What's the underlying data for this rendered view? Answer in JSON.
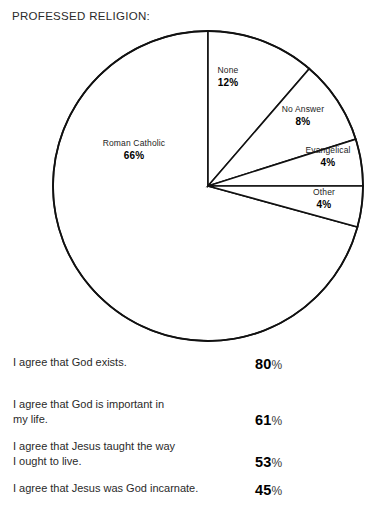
{
  "title": "PROFESSED RELIGION:",
  "chart_data": {
    "type": "pie",
    "title": "PROFESSED RELIGION:",
    "categories": [
      "Roman Catholic",
      "None",
      "No Answer",
      "Evangelical",
      "Other"
    ],
    "values": [
      66,
      12,
      8,
      4,
      4
    ],
    "unit": "%",
    "legend": "none",
    "labels_inside": true,
    "start_angle_deg": 0,
    "direction": "clockwise",
    "slices": [
      {
        "label": "Roman Catholic",
        "value": 66,
        "value_text": "66%",
        "start_deg": 105.3,
        "end_deg": 360.0
      },
      {
        "label": "None",
        "value": 12,
        "value_text": "12%",
        "start_deg": 0.0,
        "end_deg": 40.8
      },
      {
        "label": "No Answer",
        "value": 8,
        "value_text": "8%",
        "start_deg": 40.8,
        "end_deg": 72.4
      },
      {
        "label": "Evangelical",
        "value": 4,
        "value_text": "4%",
        "start_deg": 72.4,
        "end_deg": 90.0
      },
      {
        "label": "Other",
        "value": 4,
        "value_text": "4%",
        "start_deg": 90.0,
        "end_deg": 105.3
      }
    ],
    "fill_color": "#ffffff",
    "stroke_color": "#111111"
  },
  "statements": [
    {
      "line1": "I agree that God exists.",
      "line2": "",
      "value": 80,
      "value_text": "80",
      "unit": "%"
    },
    {
      "line1": "I agree that God is important in",
      "line2": "my life.",
      "value": 61,
      "value_text": "61",
      "unit": "%"
    },
    {
      "line1": "I agree that Jesus taught the way",
      "line2": "I ought to live.",
      "value": 53,
      "value_text": "53",
      "unit": "%"
    },
    {
      "line1": "I agree that Jesus was God incarnate.",
      "line2": "",
      "value": 45,
      "value_text": "45",
      "unit": "%"
    }
  ]
}
